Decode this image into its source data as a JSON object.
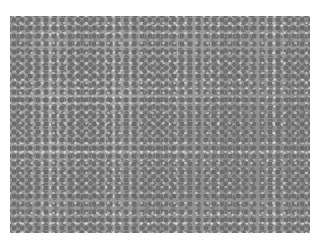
{
  "image": {
    "description": "Grayscale micrograph showing densely packed round cells with dark nuclei",
    "background_color": "#ffffff",
    "tone_color": "#9a9a9a",
    "nucleus_color": "#6e6e6e"
  }
}
